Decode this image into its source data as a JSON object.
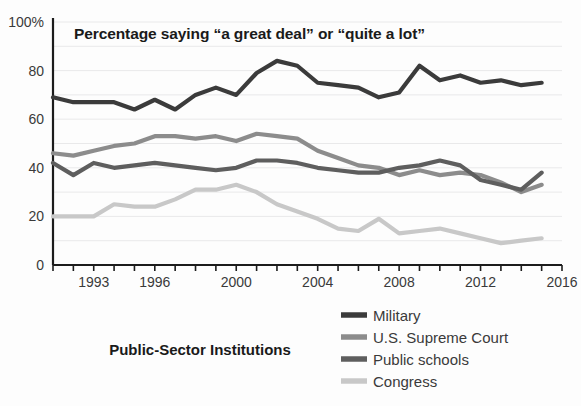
{
  "chart_data": {
    "type": "line",
    "title": "Percentage saying “a great deal” or “quite a lot”",
    "panel_label": "Public-Sector Institutions",
    "xlabel": "",
    "ylabel": "",
    "ylim": [
      0,
      100
    ],
    "xlim": [
      1991,
      2016
    ],
    "grid": true,
    "grid_step": 10,
    "legend_position": "bottom-right",
    "y_ticks": [
      0,
      20,
      40,
      60,
      80,
      100
    ],
    "y_tick_labels": [
      "0",
      "20",
      "40",
      "60",
      "80",
      "100%"
    ],
    "x_ticks": [
      1991,
      1992,
      1993,
      1994,
      1995,
      1996,
      1997,
      1998,
      1999,
      2000,
      2001,
      2002,
      2003,
      2004,
      2005,
      2006,
      2007,
      2008,
      2009,
      2010,
      2011,
      2012,
      2013,
      2014,
      2015,
      2016
    ],
    "x_tick_labels_shown": [
      "1993",
      "1996",
      "2000",
      "2004",
      "2008",
      "2012",
      "2016"
    ],
    "x": [
      1991,
      1992,
      1993,
      1994,
      1995,
      1996,
      1997,
      1998,
      1999,
      2000,
      2001,
      2002,
      2003,
      2004,
      2005,
      2006,
      2007,
      2008,
      2009,
      2010,
      2011,
      2012,
      2013,
      2014,
      2015
    ],
    "series": [
      {
        "name": "Military",
        "color": "#3b3b3b",
        "width": 4.2,
        "values": [
          69,
          67,
          67,
          67,
          64,
          68,
          64,
          70,
          73,
          70,
          79,
          84,
          82,
          75,
          74,
          73,
          69,
          71,
          82,
          76,
          78,
          75,
          76,
          74,
          75
        ]
      },
      {
        "name": "U.S. Supreme Court",
        "color": "#8c8c8c",
        "width": 4.2,
        "values": [
          46,
          45,
          47,
          49,
          50,
          53,
          53,
          52,
          53,
          51,
          54,
          53,
          52,
          47,
          44,
          41,
          40,
          37,
          39,
          37,
          38,
          37,
          34,
          30,
          33
        ]
      },
      {
        "name": "Public schools",
        "color": "#5e5e5e",
        "width": 4.2,
        "values": [
          42,
          37,
          42,
          40,
          41,
          42,
          41,
          40,
          39,
          40,
          43,
          43,
          42,
          40,
          39,
          38,
          38,
          40,
          41,
          43,
          41,
          35,
          33,
          31,
          38
        ]
      },
      {
        "name": "Congress",
        "color": "#c8c8c8",
        "width": 4.2,
        "values": [
          20,
          20,
          20,
          25,
          24,
          24,
          27,
          31,
          31,
          33,
          30,
          25,
          22,
          19,
          15,
          14,
          19,
          13,
          14,
          15,
          13,
          11,
          9,
          10,
          11
        ]
      }
    ]
  },
  "legend": {
    "items": [
      {
        "label": "Military",
        "color": "#3b3b3b"
      },
      {
        "label": "U.S. Supreme Court",
        "color": "#8c8c8c"
      },
      {
        "label": "Public schools",
        "color": "#5e5e5e"
      },
      {
        "label": "Congress",
        "color": "#c8c8c8"
      }
    ]
  }
}
